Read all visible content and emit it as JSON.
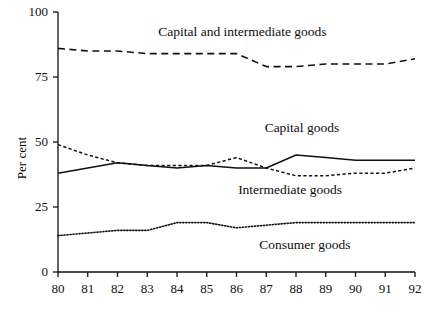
{
  "chart_data": {
    "type": "line",
    "title": "",
    "xlabel": "",
    "ylabel": "Per cent",
    "xlim": [
      80,
      92
    ],
    "ylim": [
      0,
      100
    ],
    "grid": false,
    "legend_position": "inline-annotations",
    "x": [
      80,
      81,
      82,
      83,
      84,
      85,
      86,
      87,
      88,
      89,
      90,
      91,
      92
    ],
    "xtick_labels": [
      "80",
      "81",
      "82",
      "83",
      "84",
      "85",
      "86",
      "87",
      "88",
      "89",
      "90",
      "91",
      "92"
    ],
    "ytick_labels": [
      "0",
      "25",
      "50",
      "75",
      "100"
    ],
    "yticks": [
      0,
      25,
      50,
      75,
      100
    ],
    "series": [
      {
        "name": "Capital and intermediate goods",
        "style": "dashed",
        "label": "Capital and intermediate goods",
        "values": [
          86,
          85,
          85,
          84,
          84,
          84,
          84,
          79,
          79,
          80,
          80,
          80,
          82
        ]
      },
      {
        "name": "Capital goods",
        "style": "solid",
        "label": "Capital goods",
        "values": [
          38,
          40,
          42,
          41,
          40,
          41,
          40,
          40,
          45,
          44,
          43,
          43,
          43
        ]
      },
      {
        "name": "Intermediate goods",
        "style": "dashed-fine",
        "label": "Intermediate goods",
        "values": [
          49,
          45,
          42,
          41,
          41,
          41,
          44,
          40,
          37,
          37,
          38,
          38,
          40
        ]
      },
      {
        "name": "Consumer goods",
        "style": "dotted",
        "label": "Consumer goods",
        "values": [
          14,
          15,
          16,
          16,
          19,
          19,
          17,
          18,
          19,
          19,
          19,
          19,
          19
        ]
      }
    ],
    "annotations": [
      {
        "text": "Capital and intermediate goods",
        "x": 86.2,
        "y": 92
      },
      {
        "text": "Capital goods",
        "x": 88.2,
        "y": 55
      },
      {
        "text": "Intermediate goods",
        "x": 87.8,
        "y": 31
      },
      {
        "text": "Consumer goods",
        "x": 88.3,
        "y": 10
      }
    ]
  },
  "axes": {
    "y_axis_title": "Per cent"
  },
  "footer": {
    "source_note": ""
  }
}
